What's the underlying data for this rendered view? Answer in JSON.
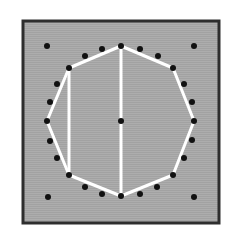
{
  "diagram": {
    "title": "",
    "colors": {
      "background": "#ffffff",
      "panel": "#a9a9a9",
      "border": "#2e2e2e",
      "dot": "#111111",
      "line": "#ffffff"
    },
    "panel": {
      "x": 23,
      "y": 21,
      "width": 196,
      "height": 202
    },
    "center_dot": [
      121,
      121
    ],
    "corner_dots": [
      [
        47,
        46
      ],
      [
        194,
        46
      ],
      [
        48,
        197
      ],
      [
        194,
        197
      ]
    ],
    "polygon_vertices": [
      [
        121,
        46
      ],
      [
        173,
        68
      ],
      [
        194,
        121
      ],
      [
        173,
        175
      ],
      [
        121,
        196
      ],
      [
        69,
        175
      ],
      [
        47,
        121
      ],
      [
        69,
        68
      ]
    ],
    "intermediate_dots": [
      [
        140,
        49
      ],
      [
        158,
        56
      ],
      [
        184,
        84
      ],
      [
        192,
        102
      ],
      [
        192,
        140
      ],
      [
        184,
        158
      ],
      [
        157,
        187
      ],
      [
        140,
        194
      ],
      [
        102,
        194
      ],
      [
        85,
        187
      ],
      [
        57,
        158
      ],
      [
        50,
        141
      ],
      [
        50,
        102
      ],
      [
        57,
        84
      ],
      [
        102,
        49
      ],
      [
        85,
        56
      ]
    ],
    "chords": [
      {
        "from": [
          121,
          46
        ],
        "to": [
          121,
          196
        ]
      },
      {
        "from": [
          69,
          68
        ],
        "to": [
          69,
          175
        ]
      }
    ]
  }
}
